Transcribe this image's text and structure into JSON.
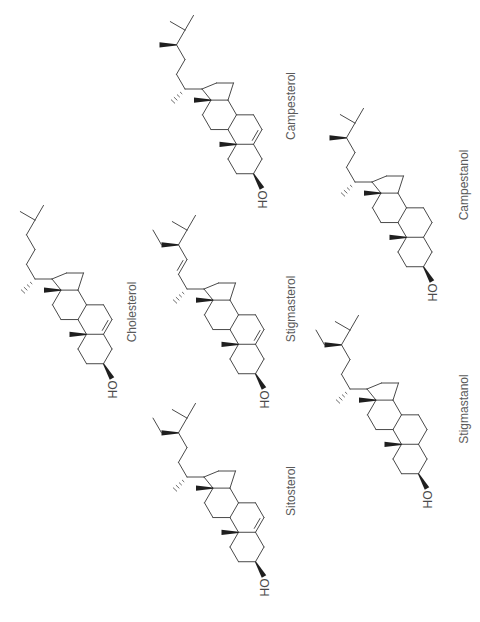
{
  "figure": {
    "background": "#ffffff",
    "colors": {
      "bond": "#4a4a4a",
      "wedge": "#1f1f1f",
      "hash": "#6a6a6a",
      "compound_label": "#5a5a5a",
      "hydroxyl_label": "#4a4a4a"
    },
    "hydroxyl_label": "HO",
    "compounds": [
      {
        "id": "cholesterol",
        "name": "Cholesterol",
        "delta5": true,
        "delta22": false,
        "c24_substituent": "none"
      },
      {
        "id": "campesterol",
        "name": "Campesterol",
        "delta5": true,
        "delta22": false,
        "c24_substituent": "methyl"
      },
      {
        "id": "campestanol",
        "name": "Campestanol",
        "delta5": false,
        "delta22": false,
        "c24_substituent": "methyl"
      },
      {
        "id": "stigmasterol",
        "name": "Stigmasterol",
        "delta5": true,
        "delta22": true,
        "c24_substituent": "ethyl"
      },
      {
        "id": "sitosterol",
        "name": "Sitosterol",
        "delta5": true,
        "delta22": false,
        "c24_substituent": "ethyl"
      },
      {
        "id": "stigmastanol",
        "name": "Stigmastanol",
        "delta5": false,
        "delta22": false,
        "c24_substituent": "ethyl"
      }
    ]
  }
}
